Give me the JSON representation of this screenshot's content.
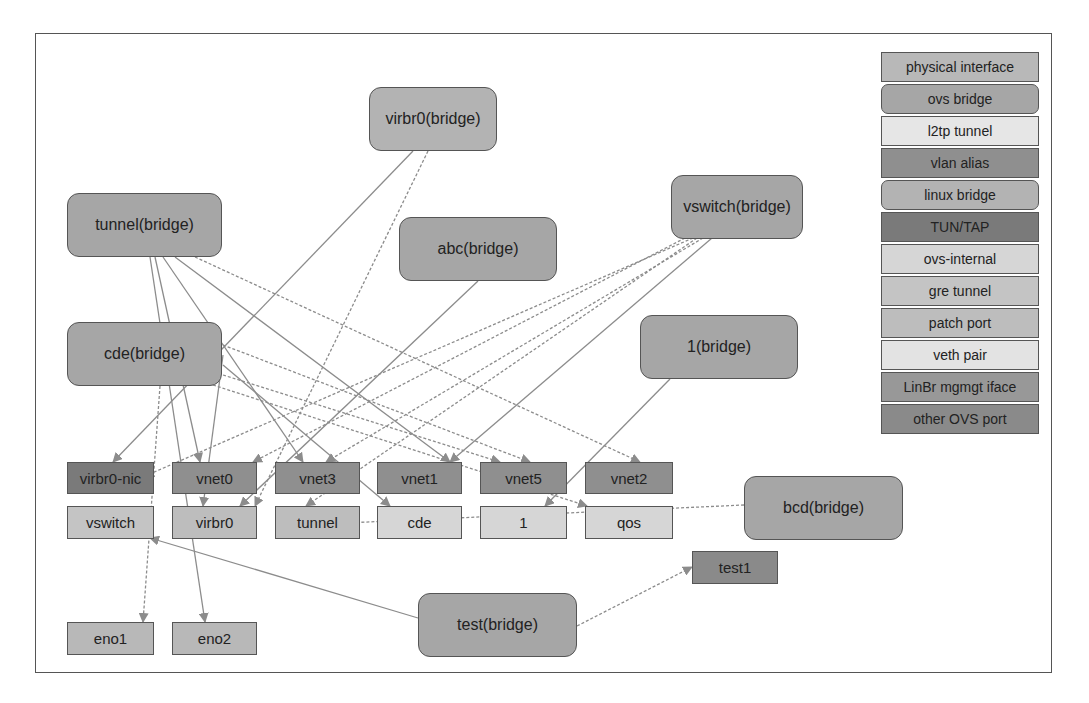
{
  "colors": {
    "physical_interface": "#b8b8b8",
    "ovs_bridge": "#a6a6a6",
    "l2tp_tunnel": "#e6e6e6",
    "vlan_alias": "#8f8f8f",
    "linux_bridge": "#b3b3b3",
    "tun_tap": "#7a7a7a",
    "ovs_internal": "#d6d6d6",
    "gre_tunnel": "#c4c4c4",
    "patch_port": "#bdbdbd",
    "veth_pair": "#e3e3e3",
    "linbr_mgmt_iface": "#989898",
    "other_ovs_port": "#8a8a8a",
    "edge": "#8c8c8c",
    "border": "#555555"
  },
  "legend": {
    "items": [
      {
        "label": "physical interface",
        "type": "physical_interface",
        "rounded": false
      },
      {
        "label": "ovs bridge",
        "type": "ovs_bridge",
        "rounded": true
      },
      {
        "label": "l2tp tunnel",
        "type": "l2tp_tunnel",
        "rounded": false
      },
      {
        "label": "vlan alias",
        "type": "vlan_alias",
        "rounded": false
      },
      {
        "label": "linux bridge",
        "type": "linux_bridge",
        "rounded": true
      },
      {
        "label": "TUN/TAP",
        "type": "tun_tap",
        "rounded": false
      },
      {
        "label": "ovs-internal",
        "type": "ovs_internal",
        "rounded": false
      },
      {
        "label": "gre tunnel",
        "type": "gre_tunnel",
        "rounded": false
      },
      {
        "label": "patch port",
        "type": "patch_port",
        "rounded": false
      },
      {
        "label": "veth pair",
        "type": "veth_pair",
        "rounded": false
      },
      {
        "label": "LinBr mgmgt iface",
        "type": "linbr_mgmt_iface",
        "rounded": false
      },
      {
        "label": "other OVS port",
        "type": "other_ovs_port",
        "rounded": false
      }
    ]
  },
  "bridges": [
    {
      "id": "virbr0-bridge",
      "label": "virbr0(bridge)",
      "x": 369,
      "y": 87,
      "w": 128,
      "h": 64,
      "type": "linux_bridge"
    },
    {
      "id": "tunnel-bridge",
      "label": "tunnel(bridge)",
      "x": 67,
      "y": 193,
      "w": 155,
      "h": 64,
      "type": "ovs_bridge"
    },
    {
      "id": "abc-bridge",
      "label": "abc(bridge)",
      "x": 399,
      "y": 217,
      "w": 158,
      "h": 64,
      "type": "ovs_bridge"
    },
    {
      "id": "vswitch-bridge",
      "label": "vswitch(bridge)",
      "x": 671,
      "y": 175,
      "w": 132,
      "h": 64,
      "type": "ovs_bridge"
    },
    {
      "id": "cde-bridge",
      "label": "cde(bridge)",
      "x": 67,
      "y": 322,
      "w": 155,
      "h": 64,
      "type": "ovs_bridge"
    },
    {
      "id": "1-bridge",
      "label": "1(bridge)",
      "x": 640,
      "y": 315,
      "w": 158,
      "h": 64,
      "type": "ovs_bridge"
    },
    {
      "id": "bcd-bridge",
      "label": "bcd(bridge)",
      "x": 744,
      "y": 476,
      "w": 159,
      "h": 64,
      "type": "ovs_bridge"
    },
    {
      "id": "test-bridge",
      "label": "test(bridge)",
      "x": 418,
      "y": 593,
      "w": 159,
      "h": 64,
      "type": "ovs_bridge"
    }
  ],
  "ports": [
    {
      "id": "virbr0-nic",
      "label": "virbr0-nic",
      "x": 67,
      "y": 462,
      "w": 87,
      "h": 32,
      "type": "tun_tap"
    },
    {
      "id": "vnet0",
      "label": "vnet0",
      "x": 172,
      "y": 462,
      "w": 85,
      "h": 32,
      "type": "vlan_alias"
    },
    {
      "id": "vnet3",
      "label": "vnet3",
      "x": 275,
      "y": 462,
      "w": 85,
      "h": 32,
      "type": "vlan_alias"
    },
    {
      "id": "vnet1",
      "label": "vnet1",
      "x": 377,
      "y": 462,
      "w": 85,
      "h": 32,
      "type": "vlan_alias"
    },
    {
      "id": "vnet5",
      "label": "vnet5",
      "x": 480,
      "y": 462,
      "w": 87,
      "h": 32,
      "type": "vlan_alias"
    },
    {
      "id": "vnet2",
      "label": "vnet2",
      "x": 585,
      "y": 462,
      "w": 88,
      "h": 32,
      "type": "vlan_alias"
    },
    {
      "id": "vswitch",
      "label": "vswitch",
      "x": 67,
      "y": 506,
      "w": 87,
      "h": 33,
      "type": "gre_tunnel"
    },
    {
      "id": "virbr0",
      "label": "virbr0",
      "x": 172,
      "y": 506,
      "w": 85,
      "h": 33,
      "type": "patch_port"
    },
    {
      "id": "tunnel",
      "label": "tunnel",
      "x": 275,
      "y": 506,
      "w": 85,
      "h": 33,
      "type": "patch_port"
    },
    {
      "id": "cde",
      "label": "cde",
      "x": 377,
      "y": 506,
      "w": 85,
      "h": 33,
      "type": "ovs_internal"
    },
    {
      "id": "1",
      "label": "1",
      "x": 480,
      "y": 506,
      "w": 87,
      "h": 33,
      "type": "ovs_internal"
    },
    {
      "id": "qos",
      "label": "qos",
      "x": 585,
      "y": 506,
      "w": 88,
      "h": 33,
      "type": "ovs_internal"
    },
    {
      "id": "test1",
      "label": "test1",
      "x": 692,
      "y": 551,
      "w": 86,
      "h": 33,
      "type": "other_ovs_port"
    },
    {
      "id": "eno1",
      "label": "eno1",
      "x": 67,
      "y": 622,
      "w": 87,
      "h": 33,
      "type": "physical_interface"
    },
    {
      "id": "eno2",
      "label": "eno2",
      "x": 172,
      "y": 622,
      "w": 85,
      "h": 33,
      "type": "physical_interface"
    }
  ],
  "edges": [
    {
      "from": [
        413,
        151
      ],
      "to": [
        113,
        462
      ],
      "dashed": false
    },
    {
      "from": [
        428,
        151
      ],
      "to": [
        255,
        506
      ],
      "dashed": true
    },
    {
      "from": [
        155,
        257
      ],
      "to": [
        200,
        462
      ],
      "dashed": false
    },
    {
      "from": [
        163,
        257
      ],
      "to": [
        303,
        462
      ],
      "dashed": false
    },
    {
      "from": [
        175,
        257
      ],
      "to": [
        450,
        462
      ],
      "dashed": false
    },
    {
      "from": [
        195,
        257
      ],
      "to": [
        640,
        462
      ],
      "dashed": true
    },
    {
      "from": [
        150,
        257
      ],
      "to": [
        205,
        622
      ],
      "dashed": false
    },
    {
      "from": [
        223,
        355
      ],
      "to": [
        203,
        506
      ],
      "dashed": false
    },
    {
      "from": [
        478,
        281
      ],
      "to": [
        240,
        506
      ],
      "dashed": false
    },
    {
      "from": [
        685,
        238
      ],
      "to": [
        253,
        462
      ],
      "dashed": true
    },
    {
      "from": [
        693,
        238
      ],
      "to": [
        145,
        476
      ],
      "dashed": true
    },
    {
      "from": [
        697,
        238
      ],
      "to": [
        306,
        506
      ],
      "dashed": true
    },
    {
      "from": [
        703,
        238
      ],
      "to": [
        326,
        462
      ],
      "dashed": true
    },
    {
      "from": [
        712,
        238
      ],
      "to": [
        450,
        462
      ],
      "dashed": false
    },
    {
      "from": [
        223,
        365
      ],
      "to": [
        390,
        506
      ],
      "dashed": false
    },
    {
      "from": [
        223,
        375
      ],
      "to": [
        500,
        462
      ],
      "dashed": true
    },
    {
      "from": [
        213,
        385
      ],
      "to": [
        587,
        506
      ],
      "dashed": true
    },
    {
      "from": [
        223,
        345
      ],
      "to": [
        530,
        462
      ],
      "dashed": true
    },
    {
      "from": [
        160,
        386
      ],
      "to": [
        143,
        622
      ],
      "dashed": true
    },
    {
      "from": [
        670,
        379
      ],
      "to": [
        545,
        506
      ],
      "dashed": false
    },
    {
      "from": [
        744,
        505
      ],
      "to": [
        345,
        523
      ],
      "dashed": true
    },
    {
      "from": [
        418,
        618
      ],
      "to": [
        150,
        538
      ],
      "dashed": false
    },
    {
      "from": [
        577,
        626
      ],
      "to": [
        692,
        567
      ],
      "dashed": true
    }
  ]
}
